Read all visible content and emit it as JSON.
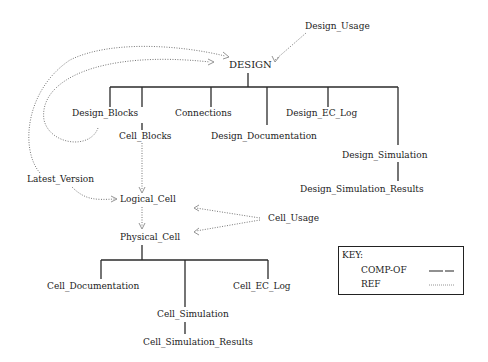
{
  "diagram": {
    "nodes": {
      "design_usage": "Design_Usage",
      "design": "DESIGN",
      "design_blocks": "Design_Blocks",
      "cell_blocks": "Cell_Blocks",
      "connections": "Connections",
      "design_documentation": "Design_Documentation",
      "design_ec_log": "Design_EC_Log",
      "design_simulation": "Design_Simulation",
      "design_simulation_results": "Design_Simulation_Results",
      "latest_version": "Latest_Version",
      "logical_cell": "Logical_Cell",
      "physical_cell": "Physical_Cell",
      "cell_usage": "Cell_Usage",
      "cell_documentation": "Cell_Documentation",
      "cell_ec_log": "Cell_EC_Log",
      "cell_simulation": "Cell_Simulation",
      "cell_simulation_results": "Cell_Simulation_Results"
    },
    "edges": [
      {
        "from": "DESIGN",
        "to": "Design_Blocks",
        "type": "COMP-OF"
      },
      {
        "from": "DESIGN",
        "to": "Cell_Blocks",
        "type": "COMP-OF"
      },
      {
        "from": "DESIGN",
        "to": "Connections",
        "type": "COMP-OF"
      },
      {
        "from": "DESIGN",
        "to": "Design_Documentation",
        "type": "COMP-OF"
      },
      {
        "from": "DESIGN",
        "to": "Design_EC_Log",
        "type": "COMP-OF"
      },
      {
        "from": "DESIGN",
        "to": "Design_Simulation",
        "type": "COMP-OF"
      },
      {
        "from": "Design_Simulation",
        "to": "Design_Simulation_Results",
        "type": "COMP-OF"
      },
      {
        "from": "Physical_Cell",
        "to": "Cell_Documentation",
        "type": "COMP-OF"
      },
      {
        "from": "Physical_Cell",
        "to": "Cell_Simulation",
        "type": "COMP-OF"
      },
      {
        "from": "Physical_Cell",
        "to": "Cell_EC_Log",
        "type": "COMP-OF"
      },
      {
        "from": "Cell_Simulation",
        "to": "Cell_Simulation_Results",
        "type": "COMP-OF"
      },
      {
        "from": "Design_Usage",
        "to": "DESIGN",
        "type": "REF"
      },
      {
        "from": "Design_Blocks",
        "to": "DESIGN",
        "type": "REF"
      },
      {
        "from": "Latest_Version",
        "to": "DESIGN",
        "type": "REF"
      },
      {
        "from": "Latest_Version",
        "to": "Logical_Cell",
        "type": "REF"
      },
      {
        "from": "Cell_Blocks",
        "to": "Logical_Cell",
        "type": "REF"
      },
      {
        "from": "Logical_Cell",
        "to": "Physical_Cell",
        "type": "REF"
      },
      {
        "from": "Cell_Usage",
        "to": "Logical_Cell",
        "type": "REF"
      },
      {
        "from": "Cell_Usage",
        "to": "Physical_Cell",
        "type": "REF"
      }
    ]
  },
  "key": {
    "title": "KEY:",
    "comp_of_label": "COMP-OF",
    "ref_label": "REF"
  },
  "colors": {
    "line": "#222222",
    "ref_line": "#777777",
    "text": "#1c1c1c"
  }
}
